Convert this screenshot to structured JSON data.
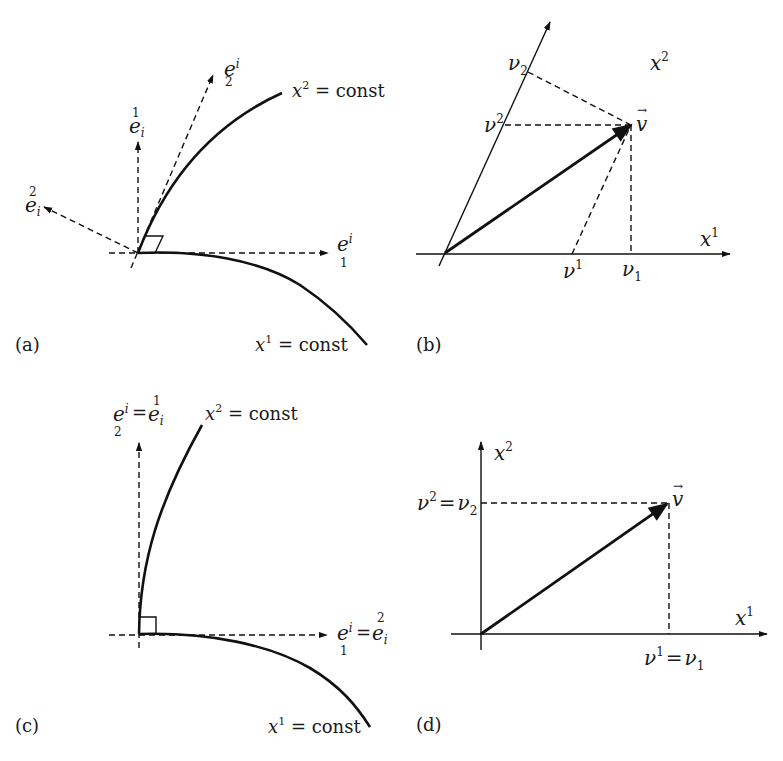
{
  "figure": {
    "panels": [
      {
        "id": "a",
        "label": "(a)",
        "curves": [
          "x² = const",
          "x¹ = const"
        ],
        "curve_labels": {
          "x2": {
            "var": "x",
            "sup": "2",
            "rest": " = const"
          },
          "x1": {
            "var": "x",
            "sup": "1",
            "rest": " = const"
          }
        },
        "vectors": {
          "e_lower1": {
            "base": "e",
            "sup": "i",
            "sub": "1"
          },
          "e_lower2": {
            "base": "e",
            "sup": "i",
            "sub": "2"
          },
          "e_upper1": {
            "base": "e",
            "sup": "1",
            "sub": "i"
          },
          "e_upper2": {
            "base": "e",
            "sup": "2",
            "sub": "i"
          }
        },
        "notes": "Non-orthogonal curvilinear coordinates: covariant basis vectors tangent to coordinate curves, contravariant basis vectors perpendicular; right-angle mark at origin is skewed."
      },
      {
        "id": "b",
        "label": "(b)",
        "axes": {
          "x1": {
            "var": "x",
            "sup": "1"
          },
          "x2": {
            "var": "x",
            "sup": "2"
          }
        },
        "vector": {
          "name": "v",
          "arrow": "→"
        },
        "components": {
          "v_sup1": {
            "base": "ν",
            "sup": "1"
          },
          "v_sub1": {
            "base": "ν",
            "sub": "1"
          },
          "v_sup2": {
            "base": "ν",
            "sup": "2"
          },
          "v_sub2": {
            "base": "ν",
            "sub": "2"
          }
        },
        "notes": "Oblique axes: contravariant components by parallel projection, covariant by perpendicular projection."
      },
      {
        "id": "c",
        "label": "(c)",
        "curves": [
          "x² = const",
          "x¹ = const"
        ],
        "curve_labels": {
          "x2": {
            "var": "x",
            "sup": "2",
            "rest": " = const"
          },
          "x1": {
            "var": "x",
            "sup": "1",
            "rest": " = const"
          }
        },
        "equalities": {
          "vertical": {
            "lhs": {
              "base": "e",
              "sup": "i",
              "sub": "2"
            },
            "eq": "=",
            "rhs": {
              "base": "e",
              "sup": "1",
              "sub": "i"
            }
          },
          "horizontal": {
            "lhs": {
              "base": "e",
              "sup": "i",
              "sub": "1"
            },
            "eq": "=",
            "rhs": {
              "base": "e",
              "sup": "2",
              "sub": "i"
            }
          }
        },
        "notes": "Orthogonal curvilinear coordinates: square right-angle mark, covariant and contravariant basis coincide."
      },
      {
        "id": "d",
        "label": "(d)",
        "axes": {
          "x1": {
            "var": "x",
            "sup": "1"
          },
          "x2": {
            "var": "x",
            "sup": "2"
          }
        },
        "vector": {
          "name": "v",
          "arrow": "→"
        },
        "components": {
          "v2": {
            "lhs_base": "ν",
            "lhs_sup": "2",
            "eq": "=",
            "rhs_base": "ν",
            "rhs_sub": "2"
          },
          "v1": {
            "lhs_base": "ν",
            "lhs_sup": "1",
            "eq": "=",
            "rhs_base": "ν",
            "rhs_sub": "1"
          }
        },
        "notes": "Orthogonal Cartesian axes: contravariant and covariant components equal."
      }
    ]
  }
}
